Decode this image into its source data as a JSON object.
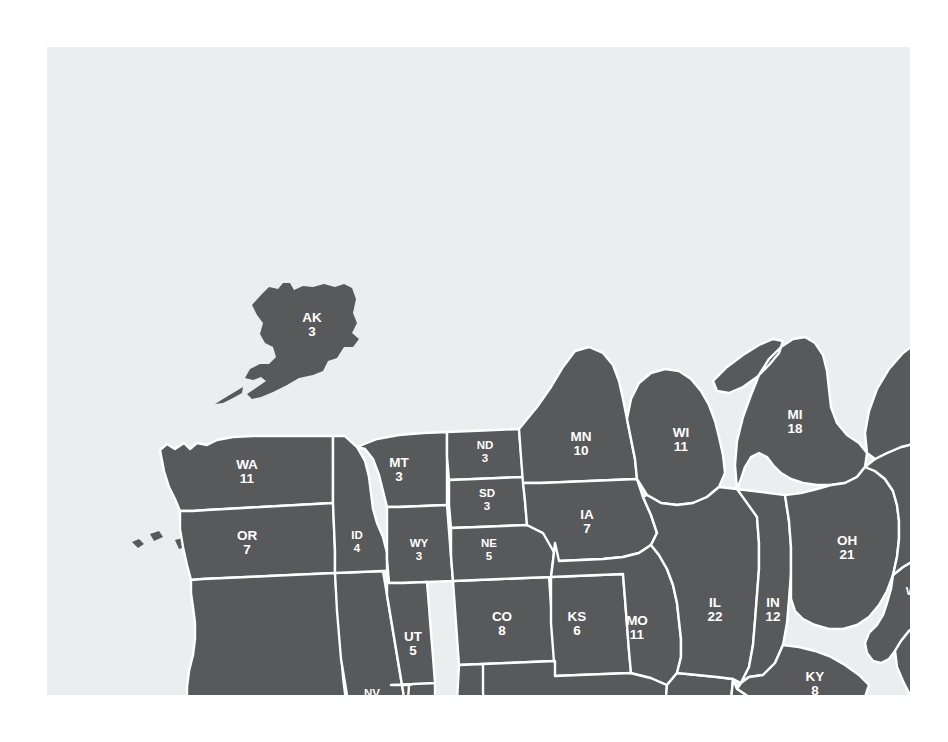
{
  "figure": {
    "kind": "us-electoral-college-map",
    "background_color": "#ffffff",
    "panel_color": "#ecedee",
    "land_color": "#58595b",
    "border_color": "#ffffff",
    "label_color": "#ffffff",
    "arrow_color": "#111111"
  },
  "callout": {
    "name": "dc-callout",
    "points_to": "District of Columbia location between Maryland and Virginia"
  },
  "states": [
    {
      "id": "AK",
      "abbr": "AK",
      "votes": "3"
    },
    {
      "id": "HI",
      "abbr": "HI",
      "votes": "4"
    },
    {
      "id": "WA",
      "abbr": "WA",
      "votes": "11"
    },
    {
      "id": "OR",
      "abbr": "OR",
      "votes": "7"
    },
    {
      "id": "CA",
      "abbr": "CA",
      "votes": "54"
    },
    {
      "id": "NV",
      "abbr": "NV",
      "votes": "4"
    },
    {
      "id": "ID",
      "abbr": "ID",
      "votes": "4"
    },
    {
      "id": "MT",
      "abbr": "MT",
      "votes": "3"
    },
    {
      "id": "WY",
      "abbr": "WY",
      "votes": "3"
    },
    {
      "id": "UT",
      "abbr": "UT",
      "votes": "5"
    },
    {
      "id": "AZ",
      "abbr": "AZ",
      "votes": "8"
    },
    {
      "id": "CO",
      "abbr": "CO",
      "votes": "8"
    },
    {
      "id": "NM",
      "abbr": "NM",
      "votes": "5"
    },
    {
      "id": "ND",
      "abbr": "ND",
      "votes": "3"
    },
    {
      "id": "SD",
      "abbr": "SD",
      "votes": "3"
    },
    {
      "id": "NE",
      "abbr": "NE",
      "votes": "5"
    },
    {
      "id": "KS",
      "abbr": "KS",
      "votes": "6"
    },
    {
      "id": "OK",
      "abbr": "OK",
      "votes": "8"
    },
    {
      "id": "TX",
      "abbr": "TX",
      "votes": "32"
    },
    {
      "id": "MN",
      "abbr": "MN",
      "votes": "10"
    },
    {
      "id": "IA",
      "abbr": "IA",
      "votes": "7"
    },
    {
      "id": "MO",
      "abbr": "MO",
      "votes": "11"
    },
    {
      "id": "AR",
      "abbr": "AR",
      "votes": "6"
    },
    {
      "id": "LA",
      "abbr": "LA",
      "votes": "9"
    },
    {
      "id": "WI",
      "abbr": "WI",
      "votes": "11"
    },
    {
      "id": "IL",
      "abbr": "IL",
      "votes": "22"
    },
    {
      "id": "MS",
      "abbr": "MS",
      "votes": "7"
    },
    {
      "id": "MI",
      "abbr": "MI",
      "votes": "18"
    },
    {
      "id": "IN",
      "abbr": "IN",
      "votes": "12"
    },
    {
      "id": "KY",
      "abbr": "KY",
      "votes": "8"
    },
    {
      "id": "TN",
      "abbr": "TN",
      "votes": "11"
    },
    {
      "id": "AL",
      "abbr": "AL",
      "votes": "9"
    },
    {
      "id": "OH",
      "abbr": "OH",
      "votes": "21"
    },
    {
      "id": "WV",
      "abbr": "WV",
      "votes": "5"
    },
    {
      "id": "GA",
      "abbr": "GA",
      "votes": "13"
    },
    {
      "id": "FL",
      "abbr": "FL",
      "votes": "25"
    },
    {
      "id": "SC",
      "abbr": "SC",
      "votes": "8"
    },
    {
      "id": "NC",
      "abbr": "NC",
      "votes": "14"
    },
    {
      "id": "VA",
      "abbr": "VA",
      "votes": "13"
    },
    {
      "id": "MD",
      "abbr": "MD",
      "votes": "10"
    },
    {
      "id": "DE",
      "abbr": "DE",
      "votes": "3"
    },
    {
      "id": "PA",
      "abbr": "PA",
      "votes": "23"
    },
    {
      "id": "NJ",
      "abbr": "NJ",
      "votes": "15"
    },
    {
      "id": "NY",
      "abbr": "NY",
      "votes": "33"
    },
    {
      "id": "CT",
      "abbr": "CT",
      "votes": "8"
    },
    {
      "id": "RI",
      "abbr": "RI",
      "votes": "4"
    },
    {
      "id": "MA",
      "abbr": "MA",
      "votes": "12"
    },
    {
      "id": "VT",
      "abbr": "VT",
      "votes": "3"
    },
    {
      "id": "NH",
      "abbr": "NH",
      "votes": "4"
    },
    {
      "id": "ME",
      "abbr": "ME",
      "votes": "4"
    },
    {
      "id": "DC",
      "abbr": "DC",
      "votes": "3"
    }
  ]
}
